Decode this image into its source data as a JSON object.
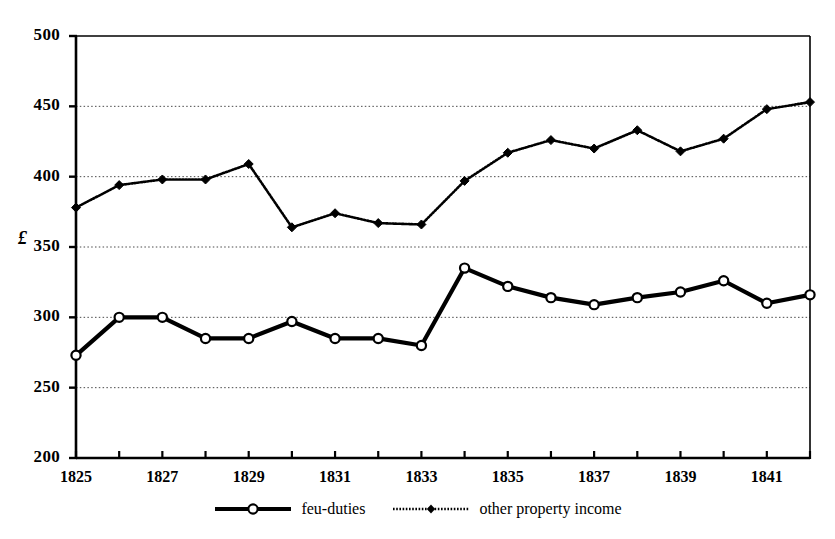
{
  "chart_data": {
    "type": "line",
    "title": "",
    "xlabel": "",
    "ylabel": "£",
    "x": [
      1825,
      1826,
      1827,
      1828,
      1829,
      1830,
      1831,
      1832,
      1833,
      1834,
      1835,
      1836,
      1837,
      1838,
      1839,
      1840,
      1841,
      1842
    ],
    "xlim": [
      1825,
      1842
    ],
    "ylim": [
      200,
      500
    ],
    "yticks": [
      200,
      250,
      300,
      350,
      400,
      450,
      500
    ],
    "ytick_labels": [
      "200",
      "250",
      "300",
      "350",
      "400",
      "450",
      "500"
    ],
    "xticks": [
      1825,
      1826,
      1827,
      1828,
      1829,
      1830,
      1831,
      1832,
      1833,
      1834,
      1835,
      1836,
      1837,
      1838,
      1839,
      1840,
      1841,
      1842
    ],
    "xtick_labels": [
      "1825",
      "",
      "1827",
      "",
      "1829",
      "",
      "1831",
      "",
      "1833",
      "",
      "1835",
      "",
      "1837",
      "",
      "1839",
      "",
      "1841",
      ""
    ],
    "grid": true,
    "grid_style": "dotted-horizontal",
    "legend_position": "bottom-center",
    "series": [
      {
        "name": "feu-duties",
        "marker": "open-circle",
        "line_style": "solid-thick",
        "color": "#000000",
        "values": [
          273,
          300,
          300,
          285,
          285,
          297,
          285,
          285,
          280,
          335,
          322,
          314,
          309,
          314,
          318,
          326,
          310,
          316
        ]
      },
      {
        "name": "other property income",
        "marker": "filled-diamond",
        "line_style": "dotted-thin",
        "color": "#000000",
        "values": [
          378,
          394,
          398,
          398,
          409,
          364,
          374,
          367,
          366,
          397,
          417,
          426,
          420,
          433,
          418,
          427,
          448,
          453
        ]
      }
    ]
  },
  "legend": {
    "items": [
      {
        "label": "feu-duties"
      },
      {
        "label": "other property income"
      }
    ]
  },
  "axes": {
    "y_title": "£"
  }
}
